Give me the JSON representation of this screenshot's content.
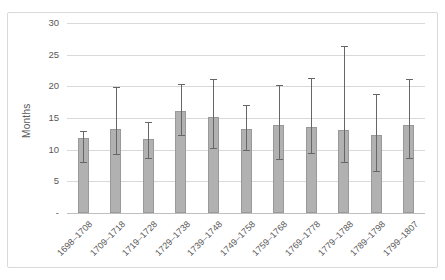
{
  "chart_data": {
    "type": "bar",
    "title": "",
    "xlabel": "",
    "ylabel": "Months",
    "ylim": [
      0,
      30
    ],
    "ytick_interval": 5,
    "ytick_labels": [
      "-",
      "5",
      "10",
      "15",
      "20",
      "25",
      "30"
    ],
    "grid": true,
    "legend": false,
    "error_bars": true,
    "categories": [
      "1698–1708",
      "1709–1718",
      "1719–1728",
      "1729–1738",
      "1739–1748",
      "1749–1758",
      "1759–1768",
      "1769–1778",
      "1779–1788",
      "1789–1798",
      "1799–1807"
    ],
    "values": [
      11.8,
      13.2,
      11.7,
      16.1,
      15.2,
      13.3,
      13.9,
      13.6,
      13.1,
      12.3,
      13.9
    ],
    "error_low": [
      8.0,
      9.3,
      8.7,
      12.3,
      10.3,
      9.9,
      8.5,
      9.5,
      8.1,
      6.7,
      8.7
    ],
    "error_high": [
      12.9,
      19.9,
      14.3,
      20.4,
      21.2,
      17.0,
      20.2,
      21.3,
      26.3,
      18.8,
      21.2
    ]
  },
  "colors": {
    "bar_fill": "#b1b1b1",
    "bar_border": "#999999",
    "error_bar": "#666666",
    "gridline": "#d9d9d9",
    "axis_line": "#bfbfbf",
    "tick_text": "#595959",
    "chart_border": "#d9d9d9",
    "background": "#ffffff"
  }
}
